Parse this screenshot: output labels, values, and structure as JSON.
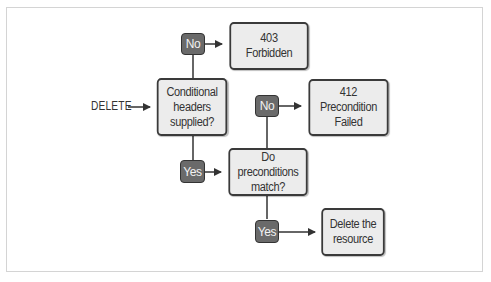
{
  "diagram": {
    "entry_label": "DELETE",
    "nodes": {
      "conditional": "Conditional\nheaders\nsupplied?",
      "forbidden": "403\nForbidden",
      "preconditions": "Do preconditions\nmatch?",
      "precondition_failed": "412\nPrecondition\nFailed",
      "delete_resource": "Delete the\nresource"
    },
    "decisions": {
      "conditional_no": "No",
      "conditional_yes": "Yes",
      "preconditions_no": "No",
      "preconditions_yes": "Yes"
    },
    "colors": {
      "box_fill": "#ececec",
      "box_border": "#3a3a3a",
      "badge_fill": "#6a6a6a",
      "badge_text": "#f2f2f2",
      "line": "#333333"
    }
  }
}
